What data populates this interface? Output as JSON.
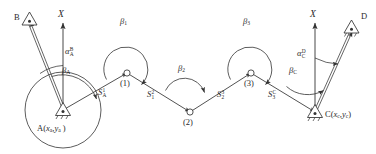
{
  "figure": {
    "type": "surveying-traverse-diagram",
    "stroke_color": "#333333",
    "background_color": "#ffffff"
  },
  "stations": {
    "A": {
      "label": "A",
      "coords_text": "(x",
      "coord_x_sub": "a",
      "coord_sep": ",",
      "coord_y": "y",
      "coord_y_sub": "a",
      "coord_close": ")",
      "full": "A(xa ,ya )",
      "marker": "triangle-with-dot"
    },
    "C": {
      "label": "C",
      "full": "C(xc ,yc)",
      "marker": "triangle-with-dot"
    },
    "B": {
      "label": "B",
      "marker": "triangle-with-dot"
    },
    "D": {
      "label": "D",
      "marker": "triangle-with-dot"
    }
  },
  "axes": [
    {
      "name": "x-axis-left",
      "label": "X"
    },
    {
      "name": "x-axis-right",
      "label": "X"
    }
  ],
  "bearings": [
    {
      "name": "alpha-AB",
      "symbol": "α",
      "sup": "B",
      "sub": "A"
    },
    {
      "name": "alpha-CD",
      "symbol": "α",
      "sup": "D",
      "sub": "C"
    }
  ],
  "angles": [
    {
      "name": "beta-A",
      "symbol": "β",
      "sub": "A"
    },
    {
      "name": "beta-1",
      "symbol": "β",
      "sub": "1"
    },
    {
      "name": "beta-2",
      "symbol": "β",
      "sub": "2"
    },
    {
      "name": "beta-3",
      "symbol": "β",
      "sub": "3"
    },
    {
      "name": "beta-C",
      "symbol": "β",
      "sub": "C"
    }
  ],
  "distances": [
    {
      "name": "s-A1",
      "symbol": "S",
      "sup": "1",
      "sub": "A"
    },
    {
      "name": "s-12",
      "symbol": "S",
      "sup": "2",
      "sub": "1"
    },
    {
      "name": "s-23",
      "symbol": "S",
      "sup": "3",
      "sub": "2"
    },
    {
      "name": "s-3C",
      "symbol": "S",
      "sup": "C",
      "sub": "3"
    }
  ],
  "joints": [
    {
      "name": "joint-1",
      "label": "(1)"
    },
    {
      "name": "joint-2",
      "label": "(2)"
    },
    {
      "name": "joint-3",
      "label": "(3)"
    }
  ]
}
